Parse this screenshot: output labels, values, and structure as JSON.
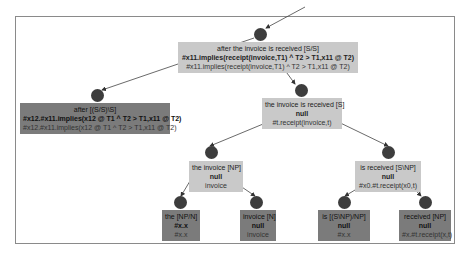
{
  "diagram": {
    "type": "derivation-tree",
    "nodes": [
      {
        "id": "root",
        "label": "after the invoice is received [S/S]",
        "bold": "#x11.implies(receipt(invoice,T1) ^ T2 > T1,x11 @ T2)",
        "sem": "#x11.implies(receipt(invoice,T1) ^ T2 > T1,x11 @ T2)",
        "shade": "light"
      },
      {
        "id": "left1",
        "label": "after [(S/S)\\S]",
        "bold": "#x12.#x11.implies(x12 @ T1 ^ T2 > T1,x11 @ T2)",
        "sem": "#x12.#x11.implies(x12 @ T1 ^ T2 > T1,x11 @ T2)",
        "shade": "dark"
      },
      {
        "id": "right1",
        "label": "the invoice is received [S]",
        "bold": "null",
        "sem": "#t.receipt(invoice,t)",
        "shade": "light"
      },
      {
        "id": "np",
        "label": "the invoice [NP]",
        "bold": "null",
        "sem": "invoice",
        "shade": "light"
      },
      {
        "id": "snp",
        "label": "is received [S\\NP]",
        "bold": "null",
        "sem": "#x0.#t.receipt(x0,t)",
        "shade": "light"
      },
      {
        "id": "the",
        "label": "the [NP/N]",
        "bold": "#x.x",
        "sem": "#x.x",
        "shade": "dark"
      },
      {
        "id": "invoice",
        "label": "invoice [N]",
        "bold": "null",
        "sem": "invoice",
        "shade": "dark"
      },
      {
        "id": "is",
        "label": "is [(S\\NP)/NP]",
        "bold": "null",
        "sem": "#x.x",
        "shade": "dark"
      },
      {
        "id": "received",
        "label": "received [NP]",
        "bold": "null",
        "sem": "#x.#t.receipt(x,t)",
        "shade": "dark"
      }
    ],
    "edges": [
      [
        "root",
        "left1"
      ],
      [
        "root",
        "right1"
      ],
      [
        "right1",
        "np"
      ],
      [
        "right1",
        "snp"
      ],
      [
        "np",
        "the"
      ],
      [
        "np",
        "invoice"
      ],
      [
        "snp",
        "is"
      ],
      [
        "snp",
        "received"
      ]
    ],
    "colors": {
      "node_fill": "#3d3d3d",
      "light_box": "#c9c9c9",
      "dark_box": "#7b7b7b",
      "frame": "#8a8a8a"
    }
  }
}
